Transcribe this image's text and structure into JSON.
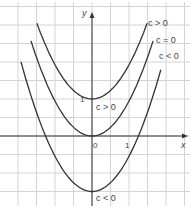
{
  "chart_data": {
    "type": "line",
    "title": "",
    "xlabel": "x",
    "ylabel": "y",
    "grid": true,
    "xlim": [
      -2.5,
      2.5
    ],
    "ylim": [
      -1.9,
      3.6
    ],
    "x_ticks": [
      {
        "value": 0,
        "label": "0"
      },
      {
        "value": 1,
        "label": "1"
      }
    ],
    "y_ticks": [
      {
        "value": 1,
        "label": "1"
      }
    ],
    "grid_step": 0.5,
    "series": [
      {
        "name": "c > 0",
        "equation": "y = a x^2 + c",
        "c": 1,
        "vertex": [
          0,
          1
        ],
        "x": [
          -1.49,
          -1.0,
          -0.5,
          0,
          0.5,
          1.0,
          1.49
        ],
        "y": [
          3.05,
          1.94,
          1.24,
          1.0,
          1.24,
          1.94,
          3.05
        ]
      },
      {
        "name": "c = 0",
        "equation": "y = a x^2",
        "c": 0,
        "vertex": [
          0,
          0
        ],
        "x": [
          -1.65,
          -1.0,
          -0.5,
          0,
          0.5,
          1.0,
          1.65
        ],
        "y": [
          2.57,
          0.94,
          0.24,
          0.0,
          0.24,
          0.94,
          2.57
        ]
      },
      {
        "name": "c < 0",
        "equation": "y = a x^2 + c",
        "c": -1.5,
        "vertex": [
          0,
          -1.5
        ],
        "x": [
          -1.92,
          -1.0,
          -0.5,
          0,
          0.5,
          1.0,
          1.86
        ],
        "y": [
          2.05,
          -0.56,
          -1.26,
          -1.5,
          -1.26,
          -0.56,
          1.75
        ]
      }
    ],
    "annotations": [
      {
        "text": "c > 0",
        "near": "top curve right end"
      },
      {
        "text": "c = 0",
        "near": "middle curve right end"
      },
      {
        "text": "c < 0",
        "near": "bottom curve right end"
      },
      {
        "text": "c > 0",
        "near": "between top vertex and origin"
      },
      {
        "text": "c < 0",
        "near": "bottom vertex"
      }
    ]
  },
  "labels": {
    "y_axis": "y",
    "x_axis": "x",
    "origin": "0",
    "x_one": "1",
    "y_one": "1",
    "curve_top": "c > 0",
    "curve_mid": "c = 0",
    "curve_bot": "c < 0",
    "vertex_top": "c > 0",
    "vertex_bot": "c < 0"
  }
}
